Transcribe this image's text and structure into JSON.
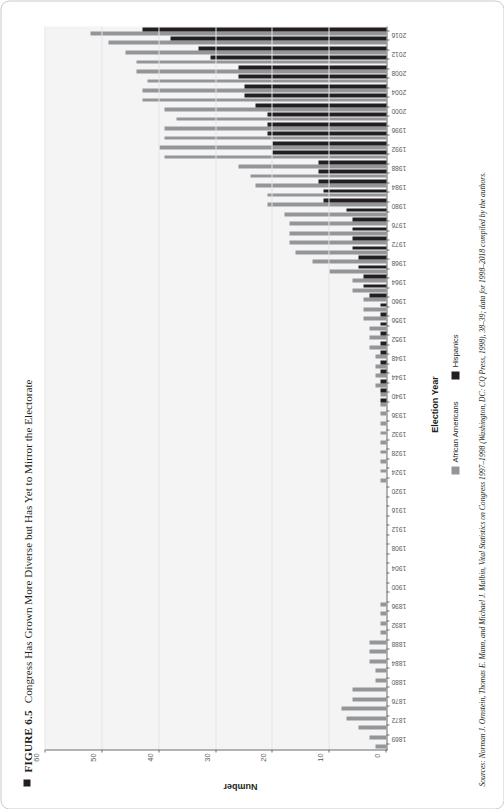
{
  "figure": {
    "marker": "square-bullet",
    "number": "FIGURE 6.5",
    "title": "Congress Has Grown More Diverse but Has Yet to Mirror the Electorate"
  },
  "source": {
    "text": "Sources: Norman J. Ornstein, Thomas E. Mann, and Michael J. Malbin, Vital Statistics on Congress 1997–1998 (Washington, DC: CQ Press, 1998), 38–39; data for 1998–2018 compiled by the authors."
  },
  "legend": {
    "position": "bottom-center",
    "items": [
      {
        "label": "African Americans",
        "color": "#939598"
      },
      {
        "label": "Hispanics",
        "color": "#231f20"
      }
    ]
  },
  "chart_data": {
    "type": "bar",
    "title": "Congress Has Grown More Diverse but Has Yet to Mirror the Electorate",
    "xlabel": "Election Year",
    "ylabel": "Number",
    "ylim": [
      0,
      60
    ],
    "yticks": [
      0,
      10,
      20,
      30,
      40,
      50,
      60
    ],
    "grid": true,
    "orientation": "vertical",
    "categories": [
      "1869",
      "1870",
      "1872",
      "1874",
      "1876",
      "1878",
      "1880",
      "1882",
      "1884",
      "1886",
      "1888",
      "1890",
      "1892",
      "1894",
      "1896",
      "1898",
      "1900",
      "1902",
      "1904",
      "1906",
      "1908",
      "1910",
      "1912",
      "1914",
      "1916",
      "1918",
      "1920",
      "1922",
      "1924",
      "1926",
      "1928",
      "1930",
      "1932",
      "1934",
      "1936",
      "1938",
      "1940",
      "1942",
      "1944",
      "1946",
      "1948",
      "1950",
      "1952",
      "1954",
      "1956",
      "1958",
      "1960",
      "1962",
      "1964",
      "1966",
      "1968",
      "1970",
      "1972",
      "1974",
      "1976",
      "1978",
      "1980",
      "1982",
      "1984",
      "1986",
      "1988",
      "1990",
      "1992",
      "1994",
      "1996",
      "1998",
      "2000",
      "2002",
      "2004",
      "2006",
      "2008",
      "2010",
      "2012",
      "2014",
      "2016",
      "2018"
    ],
    "tick_labels": [
      "1869",
      "",
      "1872",
      "",
      "1876",
      "",
      "1880",
      "",
      "1884",
      "",
      "1888",
      "",
      "1892",
      "",
      "1896",
      "",
      "1900",
      "",
      "1904",
      "",
      "1908",
      "",
      "1912",
      "",
      "1916",
      "",
      "1920",
      "",
      "1924",
      "",
      "1928",
      "",
      "1932",
      "",
      "1936",
      "",
      "1940",
      "",
      "1944",
      "",
      "1948",
      "",
      "1952",
      "",
      "1956",
      "",
      "1960",
      "",
      "1964",
      "",
      "1968",
      "",
      "1972",
      "",
      "1976",
      "",
      "1980",
      "",
      "1984",
      "",
      "1988",
      "",
      "1992",
      "",
      "1996",
      "",
      "2000",
      "",
      "2004",
      "",
      "2008",
      "",
      "2012",
      "",
      "2016",
      "",
      "2018"
    ],
    "series": [
      {
        "name": "African Americans",
        "color": "#939598",
        "values": [
          2,
          3,
          5,
          7,
          8,
          6,
          6,
          2,
          2,
          3,
          3,
          3,
          1,
          1,
          1,
          1,
          0,
          0,
          0,
          0,
          0,
          0,
          0,
          0,
          0,
          0,
          0,
          0,
          1,
          1,
          1,
          1,
          1,
          1,
          1,
          1,
          1,
          1,
          2,
          2,
          2,
          2,
          3,
          3,
          3,
          4,
          4,
          4,
          6,
          6,
          10,
          13,
          16,
          17,
          17,
          17,
          18,
          21,
          21,
          23,
          24,
          26,
          39,
          40,
          39,
          39,
          37,
          39,
          43,
          43,
          42,
          44,
          44,
          46,
          49,
          52
        ]
      },
      {
        "name": "Hispanics",
        "color": "#231f20",
        "values": [
          0,
          0,
          0,
          0,
          0,
          0,
          0,
          0,
          0,
          0,
          0,
          0,
          0,
          0,
          0,
          0,
          0,
          0,
          0,
          0,
          0,
          0,
          0,
          0,
          0,
          0,
          0,
          0,
          0,
          0,
          0,
          0,
          0,
          0,
          0,
          0,
          1,
          1,
          1,
          1,
          1,
          1,
          1,
          1,
          1,
          1,
          1,
          3,
          4,
          4,
          5,
          5,
          6,
          6,
          6,
          6,
          7,
          11,
          11,
          12,
          12,
          12,
          20,
          20,
          21,
          21,
          21,
          23,
          25,
          25,
          26,
          26,
          31,
          33,
          38,
          43
        ]
      }
    ]
  },
  "axis": {
    "x_title": "Election Year",
    "y_title": "Number"
  }
}
